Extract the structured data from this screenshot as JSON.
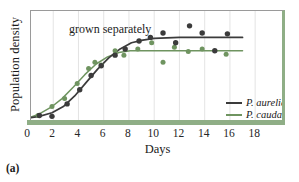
{
  "figure": {
    "panel_letter": "(a)",
    "in_plot_caption": "grown separately"
  },
  "chart_data": {
    "type": "scatter",
    "title": "grown separately",
    "xlabel": "Days",
    "ylabel": "Population density",
    "xlim": [
      0,
      19.5
    ],
    "ylim": [
      0,
      1.15
    ],
    "xticks": [
      0,
      2,
      4,
      6,
      8,
      10,
      12,
      14,
      16,
      18
    ],
    "xtick_labels": [
      "0",
      "2",
      "4",
      "6",
      "8",
      "10",
      "12",
      "14",
      "16",
      "18"
    ],
    "yticks": [],
    "ytick_labels": [],
    "grid": "vertical-only-faint",
    "legend_position": "inside-lower-right",
    "colors": {
      "aurelia": "#3b3b3b",
      "caudatum": "#6f9460",
      "axis_bar": "#8fae86",
      "frame": "#9a9a9a",
      "gridline": "#d8d8d8"
    },
    "series": [
      {
        "name": "P. aurelia",
        "color": "#3b3b3b",
        "marker": "filled-circle",
        "fit_curve": "logistic",
        "asymptote": 0.92,
        "points": [
          {
            "x": 0.9,
            "y": 0.04
          },
          {
            "x": 1.9,
            "y": 0.03
          },
          {
            "x": 3.1,
            "y": 0.17
          },
          {
            "x": 4.1,
            "y": 0.33
          },
          {
            "x": 5.0,
            "y": 0.49
          },
          {
            "x": 5.8,
            "y": 0.6
          },
          {
            "x": 6.9,
            "y": 0.72
          },
          {
            "x": 7.7,
            "y": 0.79
          },
          {
            "x": 8.8,
            "y": 0.88
          },
          {
            "x": 9.7,
            "y": 0.92
          },
          {
            "x": 10.7,
            "y": 0.97
          },
          {
            "x": 11.7,
            "y": 0.86
          },
          {
            "x": 12.8,
            "y": 1.05
          },
          {
            "x": 13.8,
            "y": 0.97
          },
          {
            "x": 14.8,
            "y": 0.77
          },
          {
            "x": 15.8,
            "y": 0.96
          }
        ],
        "curve": [
          {
            "x": 0.0,
            "y": 0.01
          },
          {
            "x": 0.9,
            "y": 0.03
          },
          {
            "x": 1.9,
            "y": 0.07
          },
          {
            "x": 2.8,
            "y": 0.14
          },
          {
            "x": 3.7,
            "y": 0.26
          },
          {
            "x": 4.6,
            "y": 0.41
          },
          {
            "x": 5.5,
            "y": 0.56
          },
          {
            "x": 6.4,
            "y": 0.69
          },
          {
            "x": 7.3,
            "y": 0.79
          },
          {
            "x": 8.2,
            "y": 0.86
          },
          {
            "x": 9.1,
            "y": 0.89
          },
          {
            "x": 10.0,
            "y": 0.91
          },
          {
            "x": 12.0,
            "y": 0.92
          },
          {
            "x": 14.0,
            "y": 0.92
          },
          {
            "x": 17.0,
            "y": 0.92
          }
        ]
      },
      {
        "name": "P. caudatum",
        "color": "#6f9460",
        "marker": "filled-circle",
        "fit_curve": "logistic",
        "asymptote": 0.77,
        "points": [
          {
            "x": 0.8,
            "y": 0.04
          },
          {
            "x": 1.9,
            "y": 0.14
          },
          {
            "x": 2.9,
            "y": 0.23
          },
          {
            "x": 3.9,
            "y": 0.4
          },
          {
            "x": 4.8,
            "y": 0.57
          },
          {
            "x": 5.3,
            "y": 0.64
          },
          {
            "x": 5.8,
            "y": 0.61
          },
          {
            "x": 6.9,
            "y": 0.77
          },
          {
            "x": 7.6,
            "y": 0.72
          },
          {
            "x": 8.7,
            "y": 0.79
          },
          {
            "x": 9.8,
            "y": 0.86
          },
          {
            "x": 10.7,
            "y": 0.64
          },
          {
            "x": 11.6,
            "y": 0.81
          },
          {
            "x": 12.7,
            "y": 0.76
          },
          {
            "x": 13.8,
            "y": 0.79
          },
          {
            "x": 15.7,
            "y": 0.73
          }
        ],
        "curve": [
          {
            "x": 0.0,
            "y": 0.01
          },
          {
            "x": 0.8,
            "y": 0.05
          },
          {
            "x": 1.8,
            "y": 0.13
          },
          {
            "x": 2.7,
            "y": 0.23
          },
          {
            "x": 3.6,
            "y": 0.36
          },
          {
            "x": 4.5,
            "y": 0.5
          },
          {
            "x": 5.4,
            "y": 0.62
          },
          {
            "x": 6.3,
            "y": 0.7
          },
          {
            "x": 7.2,
            "y": 0.75
          },
          {
            "x": 8.1,
            "y": 0.77
          },
          {
            "x": 9.0,
            "y": 0.77
          },
          {
            "x": 11.0,
            "y": 0.77
          },
          {
            "x": 14.0,
            "y": 0.77
          },
          {
            "x": 17.0,
            "y": 0.77
          }
        ]
      }
    ],
    "legend": [
      {
        "label": "P. aurelia",
        "color": "#3b3b3b"
      },
      {
        "label": "P. caudatum",
        "color": "#6f9460"
      }
    ]
  }
}
